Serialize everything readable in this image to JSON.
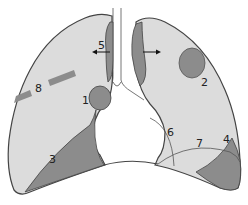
{
  "diagram": {
    "colors": {
      "lung_fill": "#dcdcdc",
      "lesion_fill": "#8c8c8c",
      "outline": "#444444",
      "trachea_outline": "#777777",
      "background": "#ffffff"
    },
    "labels": [
      {
        "id": "1",
        "text": "1",
        "description": "right hilar mass"
      },
      {
        "id": "2",
        "text": "2",
        "description": "left upper lobe nodule"
      },
      {
        "id": "3",
        "text": "3",
        "description": "right lower pleural region"
      },
      {
        "id": "4",
        "text": "4",
        "description": "left costophrenic region"
      },
      {
        "id": "5",
        "text": "5",
        "description": "right paratracheal / mediastinal region with arrow"
      },
      {
        "id": "6",
        "text": "6",
        "description": "left cardiac border line"
      },
      {
        "id": "7",
        "text": "7",
        "description": "left lower arc line"
      },
      {
        "id": "8",
        "text": "8",
        "description": "right mid-lung linear band"
      }
    ],
    "arrows": [
      {
        "id": "arrow-5",
        "direction": "left"
      },
      {
        "id": "arrow-left-mediastinum",
        "direction": "right"
      }
    ]
  }
}
